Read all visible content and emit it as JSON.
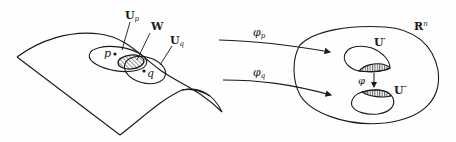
{
  "diagram": {
    "manifold": {
      "labels": {
        "Up": {
          "main": "U",
          "sub": "p"
        },
        "W": "W",
        "Uq": {
          "main": "U",
          "sub": "q"
        },
        "p": "p",
        "q": "q"
      }
    },
    "maps": {
      "phi_p": {
        "main": "φ",
        "sub": "p"
      },
      "phi_q": {
        "main": "φ",
        "sub": "q"
      },
      "phi": "φ"
    },
    "euclidean": {
      "Rn": {
        "main": "R",
        "sup": "n"
      },
      "Uprime": {
        "main": "U",
        "sup": "′"
      },
      "Udprime": {
        "main": "U",
        "sup": "″"
      }
    },
    "colors": {
      "stroke": "#1a1a1a",
      "background": "#fefefe"
    }
  }
}
